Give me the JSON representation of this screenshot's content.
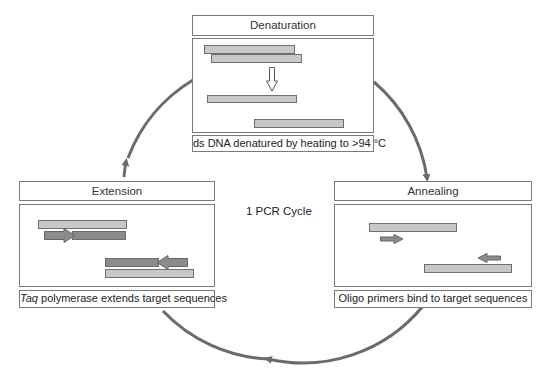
{
  "center_label": "1 PCR Cycle",
  "colors": {
    "cycle_arrow": "#6b6b6b",
    "light_strand": "#c8c8c8",
    "dark_strand": "#8c8c8c",
    "box_border": "#7a7a7a"
  },
  "steps": [
    {
      "name": "denaturation",
      "title": "Denaturation",
      "caption": "ds DNA denatured by heating to >94 °C",
      "icon": "hollow-down-arrow"
    },
    {
      "name": "annealing",
      "title": "Annealing",
      "caption": "Oligo primers bind to target sequences",
      "icon": "primer-arrows"
    },
    {
      "name": "extension",
      "title": "Extension",
      "caption_italic": "Taq",
      "caption": " polymerase extends target sequences",
      "icon": "extension-arrows"
    }
  ]
}
